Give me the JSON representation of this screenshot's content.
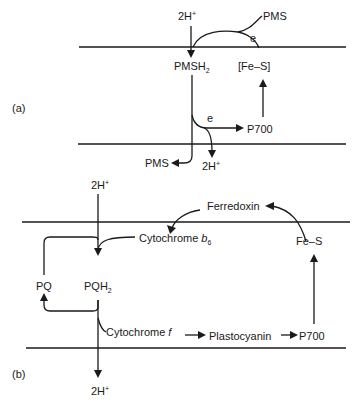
{
  "panel_a": {
    "label": "(a)",
    "top_h": "2H",
    "top_h_sup": "+",
    "pms_top": "PMS",
    "e_top": "e",
    "pmsh2": "PMSH",
    "pmsh2_sub": "2",
    "fes": "[Fe–S]",
    "e_bottom": "e",
    "p700": "P700",
    "pms_bottom": "PMS",
    "bottom_h": "2H",
    "bottom_h_sup": "+"
  },
  "panel_b": {
    "label": "(b)",
    "top_h": "2H",
    "top_h_sup": "+",
    "ferredoxin": "Ferredoxin",
    "cyt_b6": "Cytochrome",
    "cyt_b6_italic": "b",
    "cyt_b6_sub": "6",
    "fes": "Fe–S",
    "pq": "PQ",
    "pqh2": "PQH",
    "pqh2_sub": "2",
    "cyt_f": "Cytochrome",
    "cyt_f_italic": "f",
    "plastocyanin": "Plastocyanin",
    "p700": "P700",
    "bottom_h": "2H",
    "bottom_h_sup": "+"
  }
}
